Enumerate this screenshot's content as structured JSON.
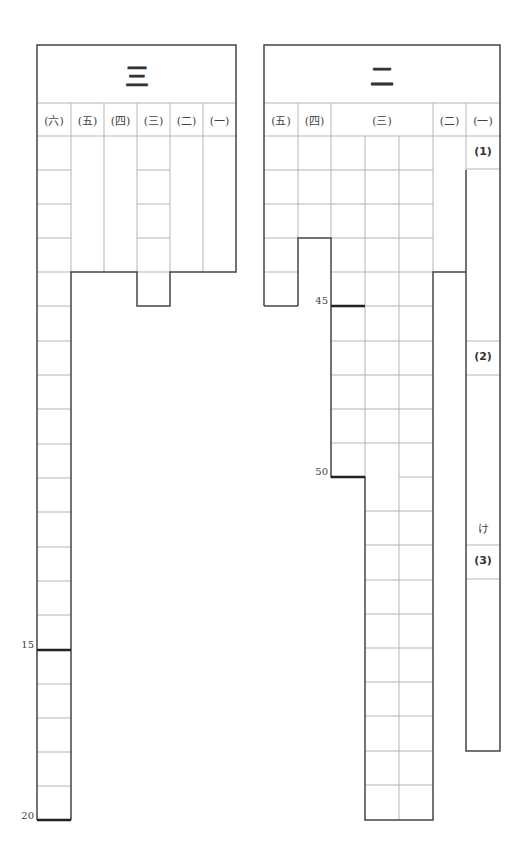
{
  "sheet": {
    "sections": [
      {
        "id": "section-3",
        "title": "三",
        "columns": [
          "(六)",
          "(五)",
          "(四)",
          "(三)",
          "(二)",
          "(一)"
        ],
        "markers": [
          {
            "label": "15",
            "row": 15
          },
          {
            "label": "20",
            "row": 20
          }
        ]
      },
      {
        "id": "section-2",
        "title": "二",
        "columns": [
          "(五)",
          "(四)",
          "(三)",
          "(二)",
          "(一)"
        ],
        "markers": [
          {
            "label": "45",
            "row": 5
          },
          {
            "label": "50",
            "row": 10
          }
        ],
        "sub_items": [
          "(1)",
          "(2)",
          "け",
          "(3)"
        ]
      }
    ]
  },
  "colors": {
    "thick_line": "#444444",
    "thin_line": "#b0b0b0",
    "marker_line": "#222222"
  }
}
